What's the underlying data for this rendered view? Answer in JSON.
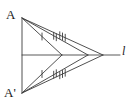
{
  "figure": {
    "type": "geometry-diagram",
    "background_color": "#ffffff",
    "stroke_color": "#3c3c3c",
    "label_color": "#1a1a1a",
    "width": 135,
    "height": 109
  },
  "labels": {
    "point_a": "A",
    "point_a_prime": "A'",
    "line_l": "l"
  },
  "points": {
    "A": {
      "x": 22,
      "y": 18
    },
    "A_prime": {
      "x": 22,
      "y": 93
    },
    "foot": {
      "x": 22,
      "y": 55
    },
    "P1": {
      "x": 62,
      "y": 55
    },
    "P2": {
      "x": 88,
      "y": 55
    },
    "P3": {
      "x": 103,
      "y": 55
    }
  },
  "line_l_segment": {
    "x1": 22,
    "y1": 55,
    "x2": 120,
    "y2": 55
  },
  "segments": [
    {
      "name": "AA-prime-vertical",
      "from": "A",
      "to": "A_prime",
      "ticks": 0
    },
    {
      "name": "A-to-P1",
      "from": "A",
      "to": "P1",
      "ticks": 1
    },
    {
      "name": "A-to-P2",
      "from": "A",
      "to": "P2",
      "ticks": 2
    },
    {
      "name": "A-to-P3",
      "from": "A",
      "to": "P3",
      "ticks": 3
    },
    {
      "name": "A-prime-to-P1",
      "from": "A_prime",
      "to": "P1",
      "ticks": 1
    },
    {
      "name": "A-prime-to-P2",
      "from": "A_prime",
      "to": "P2",
      "ticks": 2
    },
    {
      "name": "A-prime-to-P3",
      "from": "A_prime",
      "to": "P3",
      "ticks": 3
    }
  ],
  "tick_marks": {
    "pair_1_count": 1,
    "pair_2_count": 2,
    "pair_3_count": 3,
    "length": 7,
    "spacing": 3
  }
}
